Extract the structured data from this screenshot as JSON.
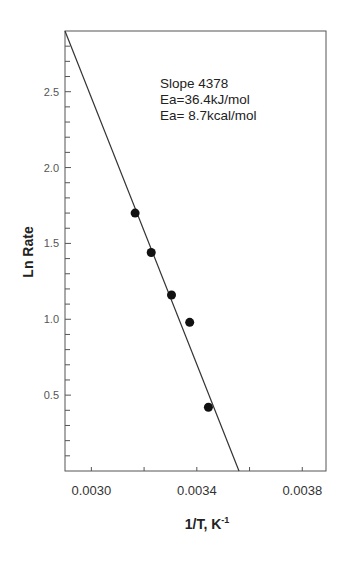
{
  "chart_data": {
    "type": "scatter",
    "title": "",
    "xlabel": "1/T, K",
    "xlabel_superscript": "-1",
    "ylabel": "Ln Rate",
    "xlim": [
      0.0029,
      0.00389
    ],
    "ylim": [
      0.0,
      2.9
    ],
    "x_ticks": [
      0.003,
      0.0034,
      0.0038
    ],
    "x_tick_labels": [
      "0.0030",
      "0.0034",
      "0.0038"
    ],
    "x_minor_step": 0.0002,
    "y_ticks": [
      0.5,
      1.0,
      1.5,
      2.0,
      2.5
    ],
    "y_tick_labels": [
      "0.5",
      "1.0",
      "1.5",
      "2.0",
      "2.5"
    ],
    "y_minor_step": 0.1,
    "grid": false,
    "legend": null,
    "series": [
      {
        "name": "data",
        "marker": "filled-circle",
        "color": "#111111",
        "x": [
          0.003166,
          0.003227,
          0.003304,
          0.003373,
          0.003444
        ],
        "y": [
          1.7,
          1.44,
          1.16,
          0.98,
          0.42
        ]
      }
    ],
    "fit_line": {
      "name": "linear fit",
      "color": "#333333",
      "x": [
        0.0029,
        0.00356
      ],
      "y": [
        2.9,
        0.0
      ]
    },
    "annotations": [
      "Slope 4378",
      "Ea=36.4kJ/mol",
      "Ea= 8.7kcal/mol"
    ]
  }
}
